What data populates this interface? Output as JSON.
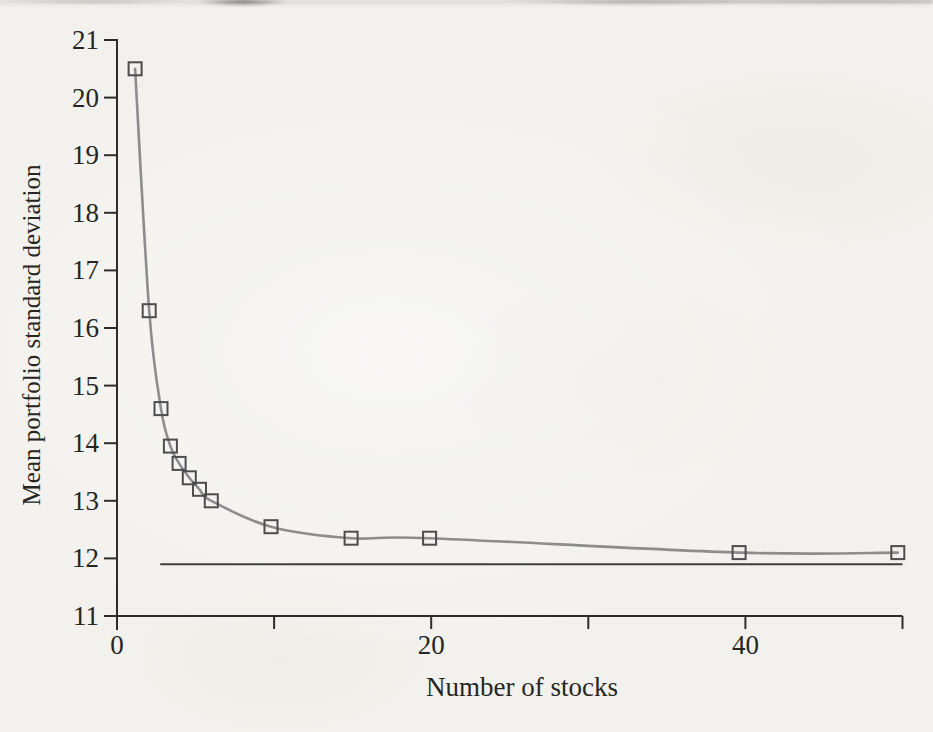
{
  "chart_data": {
    "type": "line",
    "title": "",
    "xlabel": "Number of stocks",
    "ylabel": "Mean portfolio standard deviation",
    "xlim": [
      0,
      50
    ],
    "ylim": [
      11,
      21
    ],
    "grid": false,
    "legend": false,
    "x_ticks": [
      0,
      10,
      20,
      30,
      40,
      50
    ],
    "x_tick_labels": [
      "0",
      "",
      "20",
      "",
      "40",
      ""
    ],
    "y_ticks": [
      11,
      12,
      13,
      14,
      15,
      16,
      17,
      18,
      19,
      20,
      21
    ],
    "y_tick_labels": [
      "11",
      "12",
      "13",
      "14",
      "15",
      "16",
      "17",
      "18",
      "19",
      "20",
      "21"
    ],
    "series": [
      {
        "name": "Mean portfolio standard deviation",
        "marker": "open-square",
        "x": [
          1,
          2,
          3,
          4,
          5,
          6,
          7,
          8,
          10,
          15,
          20,
          40,
          50
        ],
        "x_as_drawn": [
          1.15,
          2.05,
          2.8,
          3.4,
          3.95,
          4.6,
          5.25,
          6.0,
          9.8,
          14.9,
          19.9,
          39.6,
          49.7
        ],
        "y": [
          20.5,
          16.3,
          14.6,
          13.95,
          13.65,
          13.4,
          13.2,
          13.0,
          12.55,
          12.35,
          12.35,
          12.1,
          12.1
        ]
      }
    ],
    "reference_line": {
      "y": 11.9,
      "x_start": 2.75,
      "x_end": 50
    },
    "colors": {
      "paper": "#f2f1ed",
      "curve": "#8d8d8d",
      "marker_edge": "#4d4d4d",
      "axis": "#2e2d2b",
      "reference_line": "#3d3d3b",
      "text": "#262522"
    }
  }
}
